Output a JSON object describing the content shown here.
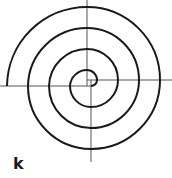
{
  "figure": {
    "label": "k",
    "colors": {
      "spiral": "#1a1a1a",
      "axes": "#555555",
      "background": "#ffffff"
    }
  }
}
